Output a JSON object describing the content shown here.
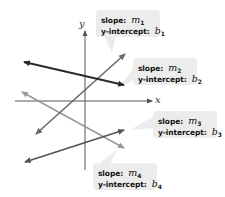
{
  "diagram": {
    "type": "coordinate-plane-lines",
    "axes": {
      "x_label": "x",
      "y_label": "y"
    },
    "lines": [
      {
        "id": 1,
        "color": "#2a2a2a",
        "from": [
          20,
          61
        ],
        "to": [
          128,
          86
        ]
      },
      {
        "id": 2,
        "color": "#6a6a6a",
        "from": [
          33,
          137
        ],
        "to": [
          128,
          51
        ]
      },
      {
        "id": 3,
        "color": "#9a9a9a",
        "from": [
          18,
          90
        ],
        "to": [
          127,
          150
        ]
      },
      {
        "id": 4,
        "color": "#555555",
        "from": [
          21,
          163
        ],
        "to": [
          127,
          129
        ]
      }
    ],
    "callouts": [
      {
        "slope_keyword": "slope:",
        "slope_var": "m",
        "slope_sub": "1",
        "intercept_keyword": "y-intercept:",
        "intercept_var": "b",
        "intercept_sub": "1"
      },
      {
        "slope_keyword": "slope:",
        "slope_var": "m",
        "slope_sub": "2",
        "intercept_keyword": "y-intercept:",
        "intercept_var": "b",
        "intercept_sub": "2"
      },
      {
        "slope_keyword": "slope:",
        "slope_var": "m",
        "slope_sub": "3",
        "intercept_keyword": "y-intercept:",
        "intercept_var": "b",
        "intercept_sub": "3"
      },
      {
        "slope_keyword": "slope:",
        "slope_var": "m",
        "slope_sub": "4",
        "intercept_keyword": "y-intercept:",
        "intercept_var": "b",
        "intercept_sub": "4"
      }
    ],
    "colors": {
      "axis": "#555555",
      "callout_bg": "#ececec",
      "text": "#111111"
    }
  }
}
